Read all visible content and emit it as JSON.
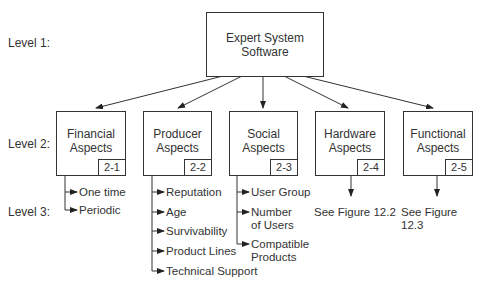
{
  "levels": {
    "level1": "Level 1:",
    "level2": "Level 2:",
    "level3": "Level 3:"
  },
  "root": {
    "title": "Expert System\nSoftware"
  },
  "nodes": [
    {
      "title": "Financial\nAspects",
      "code": "2-1",
      "children": [
        "One time",
        "Periodic"
      ]
    },
    {
      "title": "Producer\nAspects",
      "code": "2-2",
      "children": [
        "Reputation",
        "Age",
        "Survivability",
        "Product Lines",
        "Technical Support"
      ]
    },
    {
      "title": "Social\nAspects",
      "code": "2-3",
      "children": [
        "User Group",
        "Number\nof Users",
        "Compatible\nProducts"
      ]
    },
    {
      "title": "Hardware\nAspects",
      "code": "2-4",
      "reference": "See Figure 12.2"
    },
    {
      "title": "Functional\nAspects",
      "code": "2-5",
      "reference": "See Figure 12.3"
    }
  ]
}
